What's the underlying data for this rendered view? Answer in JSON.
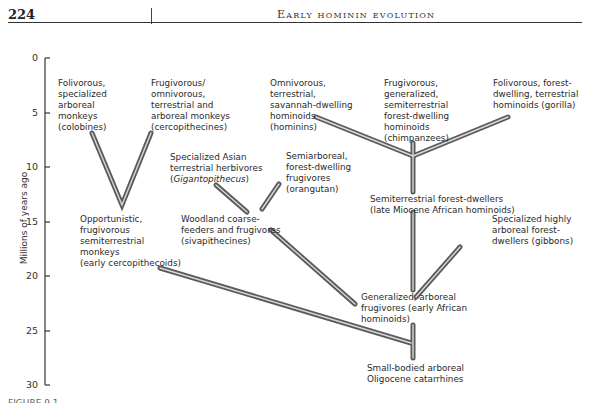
{
  "header": {
    "page_number": "224",
    "running_head": "Early hominin evolution"
  },
  "axis": {
    "title": "Millions of years ago",
    "ticks": [
      "0",
      "5",
      "10",
      "15",
      "20",
      "25",
      "30"
    ]
  },
  "nodes": {
    "colobines": [
      "Folivorous,",
      "specialized",
      "arboreal",
      "monkeys",
      "(colobines)"
    ],
    "cercopithecines": [
      "Frugivorous/",
      "omnivorous,",
      "terrestrial and",
      "arboreal monkeys",
      "(cercopithecines)"
    ],
    "hominins": [
      "Omnivorous,",
      "terrestrial,",
      "savannah-dwelling",
      "hominoids",
      "(hominins)"
    ],
    "chimpanzees": [
      "Frugivorous,",
      "generalized,",
      "semiterrestrial",
      "forest-dwelling",
      "hominoids",
      "(chimpanzees)"
    ],
    "gorilla": [
      "Folivorous, forest-",
      "dwelling, terrestrial",
      "hominoids (gorilla)"
    ],
    "gigantopithecus": [
      "Specialized Asian",
      "terrestrial herbivores",
      "(",
      "Gigantopithecus",
      ")"
    ],
    "orangutan": [
      "Semiarboreal,",
      "forest-dwelling",
      "frugivores",
      "(orangutan)"
    ],
    "late_miocene": [
      "Semiterrestrial forest-dwellers",
      "(late Miocene African hominoids)"
    ],
    "early_cercopithecoids": [
      "Opportunistic,",
      "frugivorous",
      "semiterrestrial",
      "monkeys",
      "(early cercopithecoids)"
    ],
    "sivapithecines": [
      "Woodland coarse-",
      "feeders and frugivores",
      "(sivapithecines)"
    ],
    "gibbons": [
      "Specialized highly",
      "arboreal forest-",
      "dwellers (gibbons)"
    ],
    "early_african": [
      "Generalized, arboreal",
      "frugivores (early African",
      "hominoids)"
    ],
    "catarrhines": [
      "Small-bodied arboreal",
      "Oligocene catarrhines"
    ]
  },
  "colors": {
    "branch_outer": "#5a5a5a",
    "branch_inner": "#d8d8d8",
    "axis": "#333333"
  },
  "caption": "FIGURE 9.1 ..."
}
